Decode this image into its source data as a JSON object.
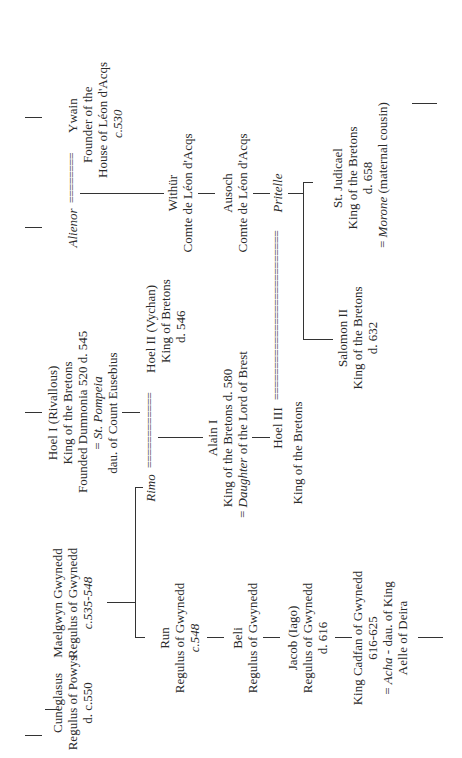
{
  "diagram": {
    "type": "family-tree",
    "orientation": "rotated-90-ccw",
    "people": {
      "cuneglasus": {
        "name": "Cuneglasus",
        "title": "Regulus of Powys",
        "dates": "d. c.550"
      },
      "maelgwyn": {
        "name": "Maelgwyn Gwynedd",
        "title": "Regulus of Gwynedd",
        "dates": "c.535-548"
      },
      "run": {
        "name": "Run",
        "title": "Regulus of Gwynedd",
        "dates": "c.548"
      },
      "beli": {
        "name": "Beli",
        "title": "Regulus of Gwynedd"
      },
      "jacob": {
        "name": "Jacob (Iago)",
        "title": "Regulus of Gwynedd",
        "dates": "d. 616"
      },
      "cadfan": {
        "name": "King Cadfan of Gwynedd",
        "dates": "616-625",
        "spouse_prefix": "= ",
        "spouse": "Acha",
        "spouse_note": " - dau. of King",
        "spouse_note2": "Aelle of Deira"
      },
      "rimo": {
        "name": "Rimo"
      },
      "hoel1": {
        "name": "Hoel I (Rivallous)",
        "title": "King of the Bretons",
        "note": "Founded Dumnonia 520 d. 545",
        "spouse_prefix": "= ",
        "spouse": "St. Pompeia",
        "spouse_note": "dau. of Count Eusebius"
      },
      "hoel2": {
        "name": "Hoel II (Vychan)",
        "title": "King of Bretons",
        "dates": "d. 546"
      },
      "alain1": {
        "name": "Alain I",
        "title": "King of the Bretons d. 580",
        "spouse_prefix": "= ",
        "spouse": "Daughter",
        "spouse_note": " of the Lord of Brest"
      },
      "hoel3": {
        "name": "Hoel III",
        "title": "King of the Bretons"
      },
      "alienor": {
        "name": "Alienor"
      },
      "ywain": {
        "name": "Ywain",
        "title": "Founder of the",
        "title2": "House of Léon d'Acqs",
        "dates": "c.530"
      },
      "withur": {
        "name": "Withür",
        "title": "Comte de Léon d'Acqs"
      },
      "ausoch": {
        "name": "Ausoch",
        "title": "Comte de Léon d'Acqs"
      },
      "pritelle": {
        "name": "Pritelle"
      },
      "salomon2": {
        "name": "Salomon II",
        "title": "King of the Bretons",
        "dates": "d. 632"
      },
      "judicael": {
        "name": "St. Judicael",
        "title": "King of the Bretons",
        "dates": "d. 658",
        "spouse_prefix": "= ",
        "spouse": "Morone",
        "spouse_note": " (maternal cousin)"
      }
    },
    "marriage_symbols": {
      "rimo_hoel2": "============",
      "alienor_ywain": "========",
      "hoel3_pritelle": "==========================="
    }
  }
}
